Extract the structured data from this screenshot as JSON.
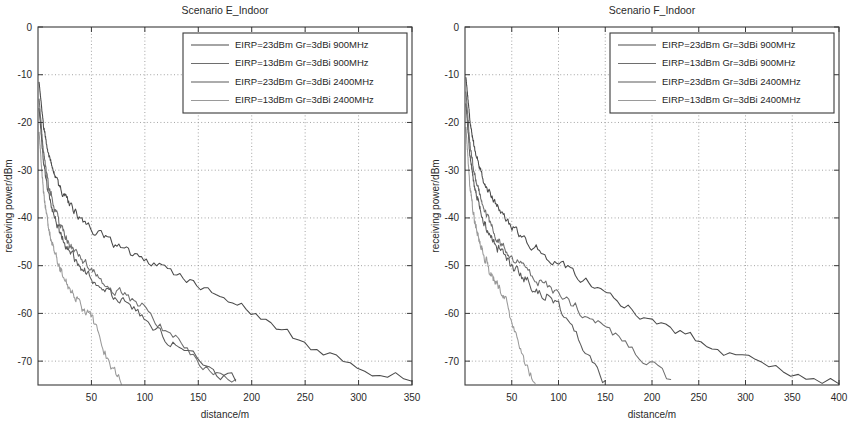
{
  "figure": {
    "background": "#ffffff",
    "panel_count": 2
  },
  "panels": [
    {
      "id": "scenario-e",
      "title": "Scenario E_Indoor",
      "xlabel": "distance/m",
      "ylabel": "receiving power/dBm"
    },
    {
      "id": "scenario-f",
      "title": "Scenario F_Indoor",
      "xlabel": "distance/m",
      "ylabel": "receiving power/dBm"
    }
  ],
  "legend": {
    "entries": [
      "EIRP=23dBm Gr=3dBi 900MHz",
      "EIRP=13dBm Gr=3dBi 900MHz",
      "EIRP=23dBm Gr=3dBi 2400MHz",
      "EIRP=13dBm Gr=3dBi 2400MHz"
    ]
  },
  "chart_data": [
    {
      "type": "line",
      "title": "Scenario E_Indoor",
      "xlabel": "distance/m",
      "ylabel": "receiving power/dBm",
      "xlim": [
        0,
        350
      ],
      "ylim": [
        -75,
        0
      ],
      "xticks": [
        50,
        100,
        150,
        200,
        250,
        300,
        350
      ],
      "yticks": [
        0,
        -10,
        -20,
        -30,
        -40,
        -50,
        -60,
        -70
      ],
      "grid": true,
      "legend_position": "top-right",
      "path_loss_model": {
        "note": "log-distance indoor model; P = EIRP + Gr - (20log10(4*pi*d0*f/c) + 10*n*log10(d/d0)) with shadowing noise",
        "n_exponent": 2.75,
        "d0_m": 1
      },
      "series": [
        {
          "name": "EIRP=23dBm Gr=3dBi 900MHz",
          "color": "#4a4a4a",
          "eirp_dbm": 23,
          "gr_dbi": 3,
          "freq_mhz": 900,
          "seed": 11,
          "x": [
            1,
            5,
            10,
            20,
            30,
            40,
            50,
            60,
            70,
            80,
            90,
            100,
            120,
            140,
            160,
            180,
            200,
            220,
            240,
            260,
            280,
            300,
            320,
            340,
            350
          ],
          "y": [
            -11.5,
            -20.5,
            -27.0,
            -33.5,
            -37.4,
            -40.2,
            -42.3,
            -44.1,
            -45.6,
            -46.9,
            -48.1,
            -49.1,
            -51.0,
            -52.6,
            -54.7,
            -57.2,
            -60.1,
            -62.6,
            -64.9,
            -67.3,
            -69.6,
            -71.2,
            -72.3,
            -73.2,
            -73.6
          ]
        },
        {
          "name": "EIRP=13dBm Gr=3dBi 900MHz",
          "color": "#6e6e6e",
          "eirp_dbm": 13,
          "gr_dbi": 3,
          "freq_mhz": 900,
          "seed": 23,
          "x": [
            1,
            5,
            10,
            20,
            30,
            40,
            50,
            60,
            70,
            80,
            90,
            100,
            110,
            120,
            130,
            140,
            150,
            160,
            170,
            180,
            185
          ],
          "y": [
            -15.0,
            -26.0,
            -33.5,
            -41.2,
            -45.5,
            -48.6,
            -51.0,
            -53.0,
            -54.7,
            -56.3,
            -57.7,
            -59.0,
            -61.5,
            -63.4,
            -65.6,
            -67.8,
            -70.0,
            -71.5,
            -72.6,
            -73.5,
            -74.2
          ]
        },
        {
          "name": "EIRP=23dBm Gr=3dBi 2400MHz",
          "color": "#5a5a5a",
          "eirp_dbm": 23,
          "gr_dbi": 3,
          "freq_mhz": 2400,
          "seed": 37,
          "x": [
            1,
            5,
            10,
            20,
            30,
            40,
            50,
            60,
            70,
            80,
            90,
            100,
            110,
            120,
            130,
            140,
            150,
            160,
            170,
            180,
            185
          ],
          "y": [
            -17.0,
            -28.0,
            -35.4,
            -43.0,
            -47.2,
            -50.2,
            -52.7,
            -54.6,
            -56.3,
            -57.9,
            -59.3,
            -60.5,
            -62.8,
            -64.9,
            -66.8,
            -68.6,
            -70.3,
            -71.6,
            -72.7,
            -73.6,
            -74.2
          ]
        },
        {
          "name": "EIRP=13dBm Gr=3dBi 2400MHz",
          "color": "#9a9a9a",
          "eirp_dbm": 13,
          "gr_dbi": 3,
          "freq_mhz": 2400,
          "seed": 53,
          "x": [
            1,
            5,
            10,
            15,
            20,
            25,
            30,
            35,
            40,
            45,
            50,
            55,
            60,
            65,
            70,
            75,
            78
          ],
          "y": [
            -22.0,
            -34.5,
            -42.3,
            -46.9,
            -50.2,
            -52.8,
            -54.9,
            -56.7,
            -58.3,
            -59.7,
            -61.0,
            -64.0,
            -66.8,
            -69.3,
            -71.5,
            -73.5,
            -74.5
          ]
        }
      ]
    },
    {
      "type": "line",
      "title": "Scenario F_Indoor",
      "xlabel": "distance/m",
      "ylabel": "receiving power/dBm",
      "xlim": [
        0,
        400
      ],
      "ylim": [
        -75,
        0
      ],
      "xticks": [
        50,
        100,
        150,
        200,
        250,
        300,
        350,
        400
      ],
      "yticks": [
        0,
        -10,
        -20,
        -30,
        -40,
        -50,
        -60,
        -70
      ],
      "grid": true,
      "legend_position": "top-right",
      "path_loss_model": {
        "note": "log-distance indoor model; P = EIRP + Gr - (20log10(4*pi*d0*f/c) + 10*n*log10(d/d0)) with shadowing noise",
        "n_exponent": 2.6,
        "d0_m": 1
      },
      "series": [
        {
          "name": "EIRP=23dBm Gr=3dBi 900MHz",
          "color": "#4a4a4a",
          "eirp_dbm": 23,
          "gr_dbi": 3,
          "freq_mhz": 900,
          "seed": 17,
          "x": [
            1,
            5,
            10,
            20,
            30,
            40,
            50,
            60,
            70,
            80,
            100,
            120,
            140,
            160,
            180,
            200,
            220,
            240,
            260,
            280,
            300,
            320,
            340,
            360,
            380,
            400
          ],
          "y": [
            -10.5,
            -19.0,
            -25.5,
            -32.2,
            -36.3,
            -39.3,
            -41.7,
            -43.7,
            -45.4,
            -46.9,
            -49.5,
            -51.8,
            -54.2,
            -56.8,
            -59.3,
            -61.6,
            -63.4,
            -65.0,
            -66.5,
            -68.0,
            -69.6,
            -71.0,
            -72.0,
            -72.8,
            -73.5,
            -74.0
          ]
        },
        {
          "name": "EIRP=13dBm Gr=3dBi 900MHz",
          "color": "#6e6e6e",
          "eirp_dbm": 13,
          "gr_dbi": 3,
          "freq_mhz": 900,
          "seed": 29,
          "x": [
            1,
            5,
            10,
            20,
            30,
            40,
            50,
            60,
            70,
            80,
            90,
            100,
            120,
            140,
            160,
            180,
            200,
            210,
            220
          ],
          "y": [
            -13.5,
            -24.0,
            -31.0,
            -38.4,
            -42.7,
            -45.8,
            -48.2,
            -50.2,
            -51.9,
            -53.4,
            -54.8,
            -56.0,
            -58.9,
            -61.7,
            -64.6,
            -67.5,
            -70.8,
            -72.6,
            -74.3
          ]
        },
        {
          "name": "EIRP=23dBm Gr=3dBi 2400MHz",
          "color": "#5a5a5a",
          "eirp_dbm": 23,
          "gr_dbi": 3,
          "freq_mhz": 2400,
          "seed": 41,
          "x": [
            1,
            5,
            10,
            20,
            30,
            40,
            50,
            60,
            70,
            80,
            90,
            100,
            110,
            120,
            130,
            140,
            150
          ],
          "y": [
            -16.0,
            -26.5,
            -33.4,
            -40.6,
            -44.8,
            -47.7,
            -50.1,
            -52.0,
            -53.7,
            -55.2,
            -56.5,
            -58.6,
            -62.0,
            -65.2,
            -68.3,
            -71.4,
            -74.3
          ]
        },
        {
          "name": "EIRP=13dBm Gr=3dBi 2400MHz",
          "color": "#9a9a9a",
          "eirp_dbm": 13,
          "gr_dbi": 3,
          "freq_mhz": 2400,
          "seed": 59,
          "x": [
            1,
            5,
            10,
            15,
            20,
            25,
            30,
            35,
            40,
            45,
            50,
            55,
            60,
            65,
            70,
            75
          ],
          "y": [
            -21.0,
            -33.0,
            -40.4,
            -44.8,
            -47.9,
            -50.4,
            -52.4,
            -54.2,
            -55.8,
            -58.5,
            -61.5,
            -64.6,
            -67.6,
            -70.4,
            -72.9,
            -74.6
          ]
        }
      ]
    }
  ],
  "style": {
    "axis_color": "#3a3a3a",
    "grid_color": "#8d8d8d",
    "text_color": "#2a2a2a",
    "background": "#ffffff"
  }
}
